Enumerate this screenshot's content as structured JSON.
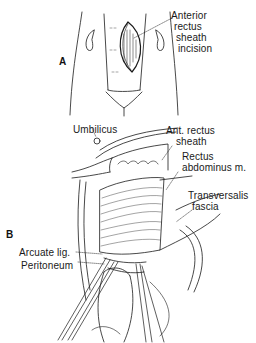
{
  "figure": {
    "panels": [
      {
        "id": "A",
        "letter": "A",
        "labels": [
          {
            "name": "anterior-rectus-sheath-incision",
            "lines": [
              "Anterior",
              "rectus",
              "sheath",
              "incision"
            ]
          }
        ]
      },
      {
        "id": "B",
        "letter": "B",
        "labels": [
          {
            "name": "umbilicus",
            "text": "Umbilicus"
          },
          {
            "name": "ant-rectus-sheath",
            "lines": [
              "Ant. rectus",
              "sheath"
            ]
          },
          {
            "name": "rectus-abdominus",
            "lines": [
              "Rectus",
              "abdominus m."
            ]
          },
          {
            "name": "transversalis-fascia",
            "lines": [
              "Transversalis",
              "fascia"
            ]
          },
          {
            "name": "arcuate-lig",
            "text": "Arcuate lig."
          },
          {
            "name": "peritoneum",
            "text": "Peritoneum"
          }
        ]
      }
    ],
    "colors": {
      "ink": "#1a1a1a",
      "background": "#ffffff"
    }
  }
}
